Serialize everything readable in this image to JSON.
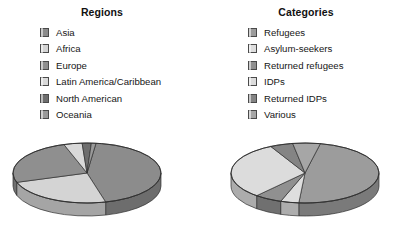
{
  "charts": [
    {
      "id": "regions",
      "title": "Regions",
      "legend_items": [
        {
          "label": "Asia",
          "color": "#8c8c8c"
        },
        {
          "label": "Africa",
          "color": "#d4d4d4"
        },
        {
          "label": "Europe",
          "color": "#8f8f8f"
        },
        {
          "label": "Latin America/Caribbean",
          "color": "#d9d9d9"
        },
        {
          "label": "North American",
          "color": "#6e6e6e"
        },
        {
          "label": "Oceania",
          "color": "#9a9a9a"
        }
      ]
    },
    {
      "id": "categories",
      "title": "Categories",
      "legend_items": [
        {
          "label": "Refugees",
          "color": "#9c9c9c"
        },
        {
          "label": "Asylum-seekers",
          "color": "#dedede"
        },
        {
          "label": "Returned refugees",
          "color": "#909090"
        },
        {
          "label": "IDPs",
          "color": "#dcdcdc"
        },
        {
          "label": "Returned IDPs",
          "color": "#848484"
        },
        {
          "label": "Various",
          "color": "#a6a6a6"
        }
      ]
    }
  ],
  "chart_data": [
    {
      "type": "pie",
      "title": "Regions",
      "three_d": true,
      "legend_position": "top",
      "categories": [
        "Asia",
        "Africa",
        "Europe",
        "Latin America/Caribbean",
        "North American",
        "Oceania"
      ],
      "values": [
        44,
        24,
        25,
        4,
        2,
        1
      ],
      "unit": "percent",
      "colors": [
        "#8c8c8c",
        "#d4d4d4",
        "#8f8f8f",
        "#d9d9d9",
        "#6e6e6e",
        "#9a9a9a"
      ]
    },
    {
      "type": "pie",
      "title": "Categories",
      "three_d": true,
      "legend_position": "top",
      "categories": [
        "Refugees",
        "Asylum-seekers",
        "Returned refugees",
        "IDPs",
        "Returned IDPs",
        "Various"
      ],
      "values": [
        48,
        4,
        6,
        31,
        5,
        6
      ],
      "unit": "percent",
      "colors": [
        "#9c9c9c",
        "#dedede",
        "#909090",
        "#dcdcdc",
        "#848484",
        "#a6a6a6"
      ]
    }
  ],
  "palette": {
    "background": "#ffffff",
    "text": "#161616",
    "outline": "#3d3d3d"
  }
}
